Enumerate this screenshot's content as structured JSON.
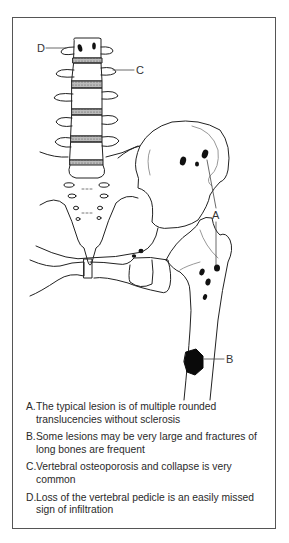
{
  "figure": {
    "callouts": [
      {
        "id": "D",
        "label": "D"
      },
      {
        "id": "C",
        "label": "C"
      },
      {
        "id": "A",
        "label": "A"
      },
      {
        "id": "B",
        "label": "B"
      }
    ],
    "legend": [
      {
        "letter": "A.",
        "text": "The typical lesion is of multiple rounded translucencies without sclerosis"
      },
      {
        "letter": "B.",
        "text": "Some lesions may be very large and fractures of long bones are frequent"
      },
      {
        "letter": "C.",
        "text": "Vertebral osteoporosis and collapse is very common"
      },
      {
        "letter": "D.",
        "text": "Loss of the vertebral pedicle is an easily missed sign of infiltration"
      }
    ]
  }
}
